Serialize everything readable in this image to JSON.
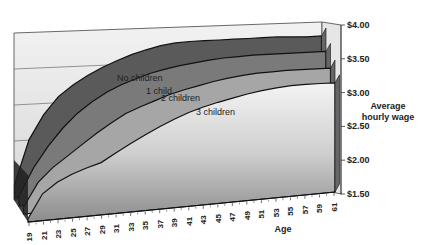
{
  "chart_data": {
    "type": "area",
    "style": "3d-stacked-area",
    "title": "",
    "xlabel": "Age",
    "ylabel": "Average hourly wage",
    "ylabel_lines": [
      "Average",
      "hourly wage"
    ],
    "ylim": [
      1.5,
      4.0
    ],
    "y_ticks": [
      "$4.00",
      "$3.50",
      "$3.00",
      "$2.50",
      "$2.00",
      "$1.50"
    ],
    "y_tick_values": [
      4.0,
      3.5,
      3.0,
      2.5,
      2.0,
      1.5
    ],
    "x_ticks": [
      "19",
      "21",
      "23",
      "25",
      "27",
      "29",
      "31",
      "33",
      "35",
      "37",
      "39",
      "41",
      "43",
      "45",
      "47",
      "49",
      "51",
      "53",
      "55",
      "57",
      "59",
      "61"
    ],
    "grid": true,
    "legend_position": "inline labels",
    "x": [
      19,
      21,
      23,
      25,
      27,
      29,
      31,
      33,
      35,
      37,
      39,
      41,
      43,
      45,
      47,
      49,
      51,
      53,
      55,
      57,
      59,
      61
    ],
    "series": [
      {
        "name": "No children",
        "color": "#5a5a5a",
        "values": [
          1.7,
          2.35,
          2.7,
          2.95,
          3.1,
          3.22,
          3.32,
          3.4,
          3.47,
          3.52,
          3.56,
          3.58,
          3.58,
          3.57,
          3.56,
          3.55,
          3.54,
          3.53,
          3.52,
          3.5,
          3.48,
          3.47
        ]
      },
      {
        "name": "1 child",
        "color": "#7a7a7a",
        "values": [
          1.65,
          2.05,
          2.35,
          2.6,
          2.8,
          2.95,
          3.07,
          3.16,
          3.23,
          3.29,
          3.33,
          3.36,
          3.38,
          3.4,
          3.41,
          3.41,
          3.41,
          3.4,
          3.39,
          3.38,
          3.37,
          3.36
        ]
      },
      {
        "name": "2 children",
        "color": "#a6a6a6",
        "values": [
          1.6,
          1.95,
          2.15,
          2.3,
          2.45,
          2.6,
          2.73,
          2.85,
          2.93,
          3.0,
          3.07,
          3.12,
          3.16,
          3.2,
          3.23,
          3.25,
          3.26,
          3.26,
          3.26,
          3.25,
          3.24,
          3.23
        ]
      },
      {
        "name": "3 children",
        "color": "#cfcfcf",
        "values": [
          1.55,
          1.9,
          2.05,
          2.15,
          2.22,
          2.28,
          2.4,
          2.52,
          2.63,
          2.73,
          2.82,
          2.9,
          2.96,
          3.01,
          3.05,
          3.09,
          3.12,
          3.14,
          3.15,
          3.15,
          3.14,
          3.13
        ]
      }
    ]
  }
}
